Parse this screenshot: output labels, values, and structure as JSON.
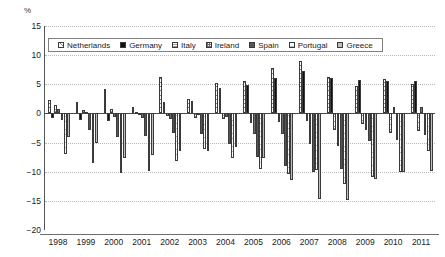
{
  "chart_data": {
    "type": "bar",
    "title": "",
    "subtitle": "",
    "unit_label": "%",
    "xlabel": "",
    "ylabel": "",
    "ylim": [
      -20,
      15
    ],
    "yticks": [
      15,
      10,
      5,
      0,
      -5,
      -10,
      -15,
      -20
    ],
    "ytick_labels": [
      "15",
      "10",
      "5",
      "0",
      "−5",
      "−10",
      "−15",
      "−20"
    ],
    "grid": true,
    "legend_position": "top-inside",
    "categories": [
      "1998",
      "1999",
      "2000",
      "2001",
      "2002",
      "2003",
      "2004",
      "2005",
      "2006",
      "2007",
      "2008",
      "2009",
      "2010",
      "2011"
    ],
    "series": [
      {
        "name": "Netherlands",
        "pattern": "diagonal-hatch",
        "color": "#fdfdfd",
        "values": [
          2.3,
          1.9,
          4.2,
          1.1,
          6.2,
          2.4,
          5.3,
          5.6,
          7.8,
          9.0,
          6.3,
          4.7,
          5.9,
          5.0
        ]
      },
      {
        "name": "Germany",
        "pattern": "solid-black",
        "color": "#111111",
        "values": [
          -0.7,
          -1.2,
          -1.3,
          0.2,
          1.9,
          2.1,
          4.3,
          4.8,
          6.1,
          7.3,
          6.0,
          5.7,
          5.6,
          5.6
        ]
      },
      {
        "name": "Italy",
        "pattern": "horizontal-hatch",
        "color": "#ffffff",
        "values": [
          1.4,
          0.6,
          0.8,
          0.0,
          -0.4,
          -0.8,
          -0.9,
          -1.6,
          -1.5,
          -1.3,
          -2.8,
          -1.9,
          -3.4,
          -3.1
        ]
      },
      {
        "name": "Ireland",
        "pattern": "crosshatch",
        "color": "#f5f5f5",
        "values": [
          0.8,
          0.3,
          -0.6,
          -0.7,
          -1.0,
          0.0,
          -0.6,
          -3.5,
          -3.6,
          -5.3,
          -5.6,
          -2.9,
          1.1,
          1.1
        ]
      },
      {
        "name": "Spain",
        "pattern": "dark-hatch",
        "color": "#555555",
        "values": [
          -1.2,
          -2.9,
          -4.0,
          -3.9,
          -3.3,
          -3.5,
          -5.2,
          -7.4,
          -9.0,
          -10.0,
          -9.6,
          -4.8,
          -4.5,
          -3.7
        ]
      },
      {
        "name": "Portugal",
        "pattern": "light-horizontal-hatch",
        "color": "#ffffff",
        "values": [
          -7.0,
          -8.5,
          -10.3,
          -9.9,
          -8.1,
          -6.1,
          -7.6,
          -9.5,
          -10.4,
          -9.7,
          -12.1,
          -10.9,
          -10.0,
          -6.4
        ]
      },
      {
        "name": "Greece",
        "pattern": "gray-hatch",
        "color": "#bfbfbf",
        "values": [
          -4.0,
          -5.0,
          -7.7,
          -7.2,
          -6.5,
          -6.5,
          -5.8,
          -7.6,
          -11.4,
          -14.6,
          -14.9,
          -11.2,
          -10.1,
          -9.9
        ]
      }
    ]
  },
  "legend": {
    "items": [
      {
        "label": "Netherlands",
        "swatch": "netherlands-swatch"
      },
      {
        "label": "Germany",
        "swatch": "germany-swatch"
      },
      {
        "label": "Italy",
        "swatch": "italy-swatch"
      },
      {
        "label": "Ireland",
        "swatch": "ireland-swatch"
      },
      {
        "label": "Spain",
        "swatch": "spain-swatch"
      },
      {
        "label": "Portugal",
        "swatch": "portugal-swatch"
      },
      {
        "label": "Greece",
        "swatch": "greece-swatch"
      }
    ]
  }
}
